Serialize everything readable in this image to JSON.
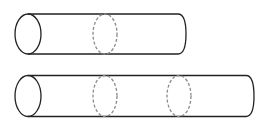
{
  "diagram": {
    "colors": {
      "outline": "#222222",
      "dashed": "#8a8a8a",
      "background": "#ffffff"
    },
    "cylinders": [
      {
        "name": "short-cylinder",
        "left_x": 28,
        "right_x": 185,
        "center_y": 34,
        "ry": 20,
        "rx": 13,
        "dashed_sections_x": [
          105
        ]
      },
      {
        "name": "long-cylinder",
        "left_x": 28,
        "right_x": 253,
        "center_y": 96,
        "ry": 20.5,
        "rx": 13,
        "dashed_sections_x": [
          105,
          179
        ]
      }
    ]
  }
}
